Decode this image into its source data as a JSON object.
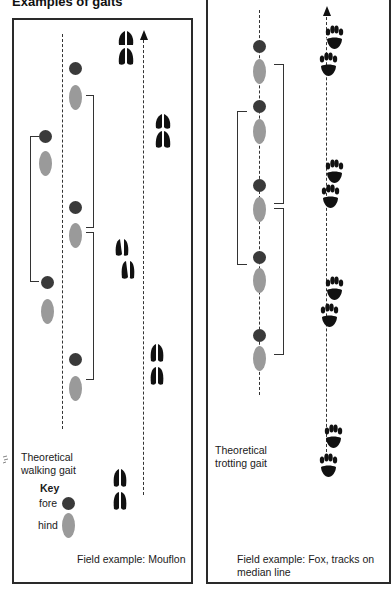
{
  "title": "Examples of gaits",
  "left_panel": {
    "label_line1": "Theoretical",
    "label_line2": "walking gait",
    "key": {
      "heading": "Key",
      "fore_label": "fore",
      "hind_label": "hind",
      "fore_color": "#3a3a3a",
      "hind_color": "#9a9a9a"
    },
    "field_example": "Field example: Mouflon",
    "track_icon": "hoof-print-icon"
  },
  "right_panel": {
    "label_line1": "Theoretical",
    "label_line2": "trotting gait",
    "field_example_line1": "Field example: Fox, tracks on",
    "field_example_line2": "median line",
    "track_icon": "paw-print-icon"
  }
}
